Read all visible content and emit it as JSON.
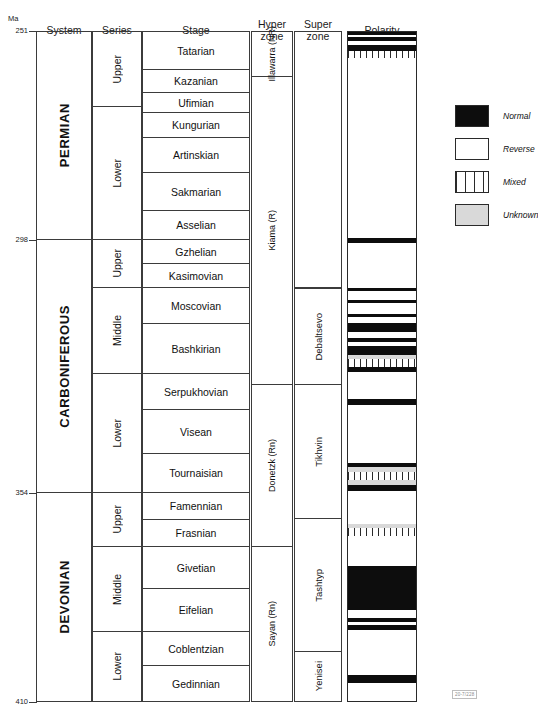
{
  "axis": {
    "unit_label": "Ma",
    "ticks": [
      {
        "value": "251",
        "y": 31
      },
      {
        "value": "298",
        "y": 240
      },
      {
        "value": "354",
        "y": 493
      },
      {
        "value": "410",
        "y": 702
      }
    ]
  },
  "headers": [
    {
      "name": "system",
      "label": "System",
      "x": 36,
      "w": 56,
      "y": 25
    },
    {
      "name": "series",
      "label": "Series",
      "x": 92,
      "w": 50,
      "y": 25
    },
    {
      "name": "stage",
      "label": "Stage",
      "x": 142,
      "w": 108,
      "y": 25
    },
    {
      "name": "hyperzone",
      "label": "Hyper\nzone",
      "x": 251,
      "w": 42,
      "y": 19
    },
    {
      "name": "superzone",
      "label": "Super\nzone",
      "x": 294,
      "w": 48,
      "y": 19
    },
    {
      "name": "polarity",
      "label": "Polarity",
      "x": 347,
      "w": 70,
      "y": 25
    }
  ],
  "systems": [
    {
      "label": "PERMIAN",
      "y": 31,
      "h": 209
    },
    {
      "label": "CARBONIFEROUS",
      "y": 240,
      "h": 253
    },
    {
      "label": "DEVONIAN",
      "y": 493,
      "h": 209
    }
  ],
  "series": [
    {
      "label": "Upper",
      "system": "PERMIAN",
      "y": 31,
      "h": 76
    },
    {
      "label": "Lower",
      "system": "PERMIAN",
      "y": 107,
      "h": 133
    },
    {
      "label": "Upper",
      "system": "CARBONIFEROUS",
      "y": 240,
      "h": 48
    },
    {
      "label": "Middle",
      "system": "CARBONIFEROUS",
      "y": 288,
      "h": 86
    },
    {
      "label": "Lower",
      "system": "CARBONIFEROUS",
      "y": 374,
      "h": 119
    },
    {
      "label": "Upper",
      "system": "DEVONIAN",
      "y": 493,
      "h": 54
    },
    {
      "label": "Middle",
      "system": "DEVONIAN",
      "y": 547,
      "h": 85
    },
    {
      "label": "Lower",
      "system": "DEVONIAN",
      "y": 632,
      "h": 70
    }
  ],
  "stages": [
    {
      "label": "Tatarian",
      "y": 31,
      "h": 39
    },
    {
      "label": "Kazanian",
      "y": 70,
      "h": 23
    },
    {
      "label": "Ufimian",
      "y": 93,
      "h": 20
    },
    {
      "label": "Kungurian",
      "y": 113,
      "h": 25
    },
    {
      "label": "Artinskian",
      "y": 138,
      "h": 35
    },
    {
      "label": "Sakmarian",
      "y": 173,
      "h": 38
    },
    {
      "label": "Asselian",
      "y": 211,
      "h": 29
    },
    {
      "label": "Gzhelian",
      "y": 240,
      "h": 24
    },
    {
      "label": "Kasimovian",
      "y": 264,
      "h": 24
    },
    {
      "label": "Moscovian",
      "y": 288,
      "h": 36
    },
    {
      "label": "Bashkirian",
      "y": 324,
      "h": 50
    },
    {
      "label": "Serpukhovian",
      "y": 374,
      "h": 36
    },
    {
      "label": "Visean",
      "y": 410,
      "h": 44
    },
    {
      "label": "Tournaisian",
      "y": 454,
      "h": 39
    },
    {
      "label": "Famennian",
      "y": 493,
      "h": 27
    },
    {
      "label": "Frasnian",
      "y": 520,
      "h": 27
    },
    {
      "label": "Givetian",
      "y": 547,
      "h": 42
    },
    {
      "label": "Eifelian",
      "y": 589,
      "h": 43
    },
    {
      "label": "Coblentzian",
      "y": 632,
      "h": 34
    },
    {
      "label": "Gedinnian",
      "y": 666,
      "h": 36
    }
  ],
  "hyperzones": [
    {
      "label": "Illawarra\n(NR)",
      "y": 31,
      "h": 46
    },
    {
      "label": "Kiama (R)",
      "y": 77,
      "h": 308
    },
    {
      "label": "Donetzk (Rn)",
      "y": 385,
      "h": 162
    },
    {
      "label": "Sayan (Rn)",
      "y": 547,
      "h": 155
    }
  ],
  "superzones": [
    {
      "label": "Debaltsevo",
      "y": 288,
      "h": 97
    },
    {
      "label": "Tikhvin",
      "y": 385,
      "h": 134
    },
    {
      "label": "Tashtyp",
      "y": 519,
      "h": 133
    },
    {
      "label": "Yenisei",
      "y": 652,
      "h": 50
    }
  ],
  "polarity_column": {
    "x": 347,
    "y": 31,
    "w": 70,
    "h": 671
  },
  "legend": {
    "x": 455,
    "y": 105,
    "items": [
      {
        "type": "normal",
        "label": "Normal"
      },
      {
        "type": "reverse",
        "label": "Reverse"
      },
      {
        "type": "mixed",
        "label": "Mixed"
      },
      {
        "type": "unknown",
        "label": "Unknown"
      }
    ]
  },
  "figure_code": "20-7/228",
  "chart_data": {
    "type": "table",
    "xlabel": "",
    "ylabel": "Ma",
    "ylim": [
      410,
      251
    ],
    "grid": false,
    "legend_position": "right",
    "axis_ticks_ma": [
      251,
      298,
      354,
      410
    ],
    "columns": [
      "Ma",
      "System",
      "Series",
      "Stage",
      "Hyper zone",
      "Super zone",
      "Polarity"
    ],
    "rows": [
      {
        "system": "PERMIAN",
        "series": "Upper",
        "stage": "Tatarian",
        "hyperzone": "Illawarra (NR)",
        "superzone": ""
      },
      {
        "system": "PERMIAN",
        "series": "Upper",
        "stage": "Kazanian",
        "hyperzone": "Kiama (R)",
        "superzone": ""
      },
      {
        "system": "PERMIAN",
        "series": "Upper",
        "stage": "Ufimian",
        "hyperzone": "Kiama (R)",
        "superzone": ""
      },
      {
        "system": "PERMIAN",
        "series": "Lower",
        "stage": "Kungurian",
        "hyperzone": "Kiama (R)",
        "superzone": ""
      },
      {
        "system": "PERMIAN",
        "series": "Lower",
        "stage": "Artinskian",
        "hyperzone": "Kiama (R)",
        "superzone": ""
      },
      {
        "system": "PERMIAN",
        "series": "Lower",
        "stage": "Sakmarian",
        "hyperzone": "Kiama (R)",
        "superzone": ""
      },
      {
        "system": "PERMIAN",
        "series": "Lower",
        "stage": "Asselian",
        "hyperzone": "Kiama (R)",
        "superzone": ""
      },
      {
        "system": "CARBONIFEROUS",
        "series": "Upper",
        "stage": "Gzhelian",
        "hyperzone": "Kiama (R)",
        "superzone": ""
      },
      {
        "system": "CARBONIFEROUS",
        "series": "Upper",
        "stage": "Kasimovian",
        "hyperzone": "Kiama (R)",
        "superzone": ""
      },
      {
        "system": "CARBONIFEROUS",
        "series": "Middle",
        "stage": "Moscovian",
        "hyperzone": "Kiama (R)",
        "superzone": "Debaltsevo"
      },
      {
        "system": "CARBONIFEROUS",
        "series": "Middle",
        "stage": "Bashkirian",
        "hyperzone": "Kiama (R)",
        "superzone": "Debaltsevo"
      },
      {
        "system": "CARBONIFEROUS",
        "series": "Lower",
        "stage": "Serpukhovian",
        "hyperzone": "Donetzk (Rn)",
        "superzone": "Tikhvin"
      },
      {
        "system": "CARBONIFEROUS",
        "series": "Lower",
        "stage": "Visean",
        "hyperzone": "Donetzk (Rn)",
        "superzone": "Tikhvin"
      },
      {
        "system": "CARBONIFEROUS",
        "series": "Lower",
        "stage": "Tournaisian",
        "hyperzone": "Donetzk (Rn)",
        "superzone": "Tikhvin"
      },
      {
        "system": "DEVONIAN",
        "series": "Upper",
        "stage": "Famennian",
        "hyperzone": "Donetzk (Rn)",
        "superzone": "Tikhvin"
      },
      {
        "system": "DEVONIAN",
        "series": "Upper",
        "stage": "Frasnian",
        "hyperzone": "Donetzk (Rn)",
        "superzone": "Tashtyp"
      },
      {
        "system": "DEVONIAN",
        "series": "Middle",
        "stage": "Givetian",
        "hyperzone": "Sayan (Rn)",
        "superzone": "Tashtyp"
      },
      {
        "system": "DEVONIAN",
        "series": "Middle",
        "stage": "Eifelian",
        "hyperzone": "Sayan (Rn)",
        "superzone": "Tashtyp"
      },
      {
        "system": "DEVONIAN",
        "series": "Lower",
        "stage": "Coblentzian",
        "hyperzone": "Sayan (Rn)",
        "superzone": "Yenisei"
      },
      {
        "system": "DEVONIAN",
        "series": "Lower",
        "stage": "Gedinnian",
        "hyperzone": "Sayan (Rn)",
        "superzone": "Yenisei"
      }
    ],
    "polarity_bands": [
      {
        "type": "normal",
        "top": 0,
        "height": 3
      },
      {
        "type": "reverse",
        "top": 3,
        "height": 2
      },
      {
        "type": "normal",
        "top": 5,
        "height": 4
      },
      {
        "type": "reverse",
        "top": 9,
        "height": 4
      },
      {
        "type": "normal",
        "top": 13,
        "height": 6
      },
      {
        "type": "mixed",
        "top": 19,
        "height": 7
      },
      {
        "type": "reverse",
        "top": 26,
        "height": 180
      },
      {
        "type": "normal",
        "top": 206,
        "height": 5
      },
      {
        "type": "reverse",
        "top": 211,
        "height": 45
      },
      {
        "type": "normal",
        "top": 256,
        "height": 3
      },
      {
        "type": "reverse",
        "top": 259,
        "height": 9
      },
      {
        "type": "normal",
        "top": 268,
        "height": 3
      },
      {
        "type": "reverse",
        "top": 271,
        "height": 11
      },
      {
        "type": "normal",
        "top": 282,
        "height": 3
      },
      {
        "type": "reverse",
        "top": 285,
        "height": 6
      },
      {
        "type": "normal",
        "top": 291,
        "height": 9
      },
      {
        "type": "reverse",
        "top": 300,
        "height": 6
      },
      {
        "type": "normal",
        "top": 306,
        "height": 4
      },
      {
        "type": "reverse",
        "top": 310,
        "height": 4
      },
      {
        "type": "normal",
        "top": 314,
        "height": 9
      },
      {
        "type": "unknown",
        "top": 323,
        "height": 4
      },
      {
        "type": "mixed",
        "top": 327,
        "height": 8
      },
      {
        "type": "normal",
        "top": 335,
        "height": 5
      },
      {
        "type": "reverse",
        "top": 340,
        "height": 27
      },
      {
        "type": "normal",
        "top": 367,
        "height": 6
      },
      {
        "type": "reverse",
        "top": 373,
        "height": 58
      },
      {
        "type": "normal",
        "top": 431,
        "height": 4
      },
      {
        "type": "unknown",
        "top": 435,
        "height": 5
      },
      {
        "type": "mixed",
        "top": 440,
        "height": 8
      },
      {
        "type": "unknown",
        "top": 448,
        "height": 5
      },
      {
        "type": "normal",
        "top": 453,
        "height": 6
      },
      {
        "type": "reverse",
        "top": 459,
        "height": 33
      },
      {
        "type": "unknown",
        "top": 492,
        "height": 4
      },
      {
        "type": "mixed",
        "top": 496,
        "height": 8
      },
      {
        "type": "reverse",
        "top": 504,
        "height": 30
      },
      {
        "type": "normal",
        "top": 534,
        "height": 44
      },
      {
        "type": "reverse",
        "top": 578,
        "height": 8
      },
      {
        "type": "normal",
        "top": 586,
        "height": 4
      },
      {
        "type": "reverse",
        "top": 590,
        "height": 3
      },
      {
        "type": "normal",
        "top": 593,
        "height": 5
      },
      {
        "type": "reverse",
        "top": 598,
        "height": 45
      },
      {
        "type": "normal",
        "top": 643,
        "height": 8
      },
      {
        "type": "reverse",
        "top": 651,
        "height": 20
      }
    ]
  }
}
